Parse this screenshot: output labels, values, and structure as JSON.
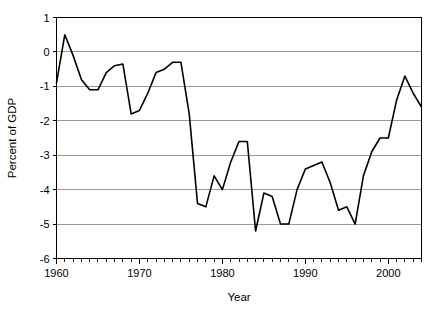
{
  "chart_data": {
    "type": "line",
    "title": "",
    "subtitle": "",
    "xlabel": "Year",
    "ylabel": "Percent of GDP",
    "xlim": [
      1960,
      2004
    ],
    "ylim": [
      -6,
      1
    ],
    "grid": true,
    "grid_axis": "y",
    "legend": false,
    "legend_position": "none",
    "x_tick_labels": [
      "1960",
      "1970",
      "1980",
      "1990",
      "2000"
    ],
    "x_tick_values": [
      1960,
      1970,
      1980,
      1990,
      2000
    ],
    "x_minor_tick_interval": 1,
    "y_tick_labels": [
      "1",
      "0",
      "-1",
      "-2",
      "-3",
      "-4",
      "-5",
      "-6"
    ],
    "y_tick_values": [
      1,
      0,
      -1,
      -2,
      -3,
      -4,
      -5,
      -6
    ],
    "series": [
      {
        "name": "Percent of GDP",
        "color": "#000000",
        "x": [
          1960,
          1961,
          1962,
          1963,
          1964,
          1965,
          1966,
          1967,
          1968,
          1969,
          1970,
          1971,
          1972,
          1973,
          1974,
          1975,
          1976,
          1977,
          1978,
          1979,
          1980,
          1981,
          1982,
          1983,
          1984,
          1985,
          1986,
          1987,
          1988,
          1989,
          1990,
          1991,
          1992,
          1993,
          1994,
          1995,
          1996,
          1997,
          1998,
          1999,
          2000,
          2001,
          2002,
          2003,
          2004
        ],
        "values": [
          -0.9,
          0.5,
          -0.1,
          -0.8,
          -1.1,
          -1.1,
          -0.6,
          -0.4,
          -0.35,
          -1.8,
          -1.7,
          -1.2,
          -0.6,
          -0.5,
          -0.3,
          -0.3,
          -1.8,
          -4.4,
          -4.5,
          -3.6,
          -4.0,
          -3.2,
          -2.6,
          -2.6,
          -5.2,
          -4.1,
          -4.2,
          -5.0,
          -5.0,
          -4.0,
          -3.4,
          -3.3,
          -3.2,
          -3.8,
          -4.6,
          -4.5,
          -5.0,
          -3.6,
          -2.9,
          -2.5,
          -2.5,
          -1.4,
          -0.7,
          -1.2,
          -1.6
        ]
      }
    ]
  },
  "axes": {
    "y_axis_title": "Percent of GDP",
    "x_axis_title": "Year"
  },
  "colors": {
    "line": "#000000",
    "gridline": "#9a9a9a",
    "axis": "#000000",
    "background": "#ffffff"
  }
}
